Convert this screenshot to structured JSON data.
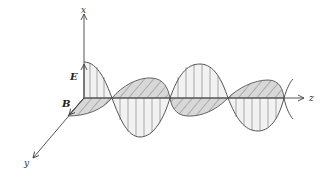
{
  "diagram": {
    "axes": {
      "x_label": "x",
      "y_label": "y",
      "z_label": "z"
    },
    "fields": {
      "electric_label": "E",
      "magnetic_label": "B"
    },
    "colors": {
      "stroke": "#555555",
      "axis": "#444444",
      "fill_light": "#f1f1f1",
      "fill_hatched": "#d6d6d6",
      "hatch": "#666666"
    }
  }
}
